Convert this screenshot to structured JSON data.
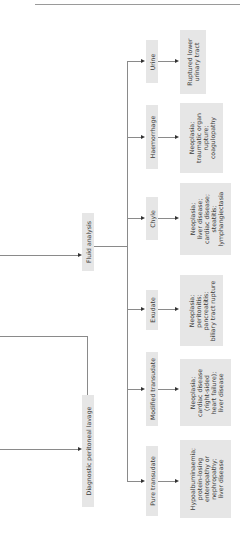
{
  "diagram": {
    "orientation": "rotated-90-ccw",
    "colors": {
      "box_fill": "#e6e6e6",
      "line": "#8a8a8a",
      "arrow": "#333333",
      "text": "#3a3a3a"
    },
    "entry_nodes": [
      {
        "id": "fluid-analysis",
        "label": "Fluid analysis"
      },
      {
        "id": "dpl",
        "label": "Diagnostic peritoneal lavage"
      }
    ],
    "categories": [
      {
        "id": "urine",
        "label": "Urine",
        "result": "Ruptured lower\nurinary tract"
      },
      {
        "id": "haemorrhage",
        "label": "Haemorrhage",
        "result": "Neoplasia;\ntraumatic organ\nrupture;\ncoagulopathy"
      },
      {
        "id": "chyle",
        "label": "Chyle",
        "result": "Neoplasia;\nliver disease;\ncardiac disease;\nsteatitis;\nlymphangiectasia"
      },
      {
        "id": "exudate",
        "label": "Exudate",
        "result": "Neoplasia;\nperitonitis;\npancreatitis;\nbiliary tract rupture"
      },
      {
        "id": "modified-transudate",
        "label": "Modified transudate",
        "result": "Neoplasia;\ncardiac disease\n(right-sided\nheart failure);\nliver disease"
      },
      {
        "id": "pure-transudate",
        "label": "Pure transudate",
        "result": "Hypoalbuminaemia;\nprotein-losing\nenteropathy or\nnephropathy;\nliver disease"
      }
    ]
  }
}
